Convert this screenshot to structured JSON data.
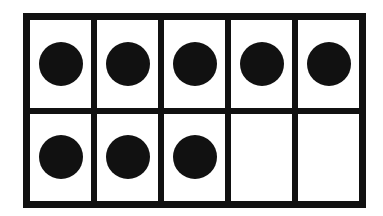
{
  "ten_frame": {
    "rows": 2,
    "columns": 5,
    "filled_count": 8,
    "total_cells": 10,
    "colors": {
      "border": "#111111",
      "counter": "#111111",
      "cell": "#ffffff"
    },
    "cells": [
      {
        "row": 1,
        "col": 1,
        "filled": true
      },
      {
        "row": 1,
        "col": 2,
        "filled": true
      },
      {
        "row": 1,
        "col": 3,
        "filled": true
      },
      {
        "row": 1,
        "col": 4,
        "filled": true
      },
      {
        "row": 1,
        "col": 5,
        "filled": true
      },
      {
        "row": 2,
        "col": 1,
        "filled": true
      },
      {
        "row": 2,
        "col": 2,
        "filled": true
      },
      {
        "row": 2,
        "col": 3,
        "filled": true
      },
      {
        "row": 2,
        "col": 4,
        "filled": false
      },
      {
        "row": 2,
        "col": 5,
        "filled": false
      }
    ]
  }
}
